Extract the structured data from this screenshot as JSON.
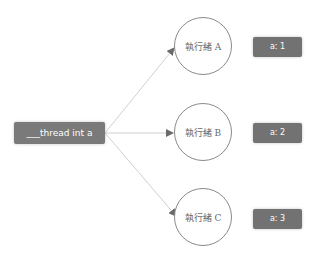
{
  "source": {
    "label": "___thread int a"
  },
  "threads": [
    {
      "label": "執行緒 A",
      "value": "a: 1"
    },
    {
      "label": "執行緒 B",
      "value": "a: 2"
    },
    {
      "label": "執行緒 C",
      "value": "a: 3"
    }
  ],
  "colors": {
    "box": "#727272",
    "edge": "#cfcfcf",
    "circle": "#8a8a8a",
    "arrow": "#6a6a6a"
  }
}
